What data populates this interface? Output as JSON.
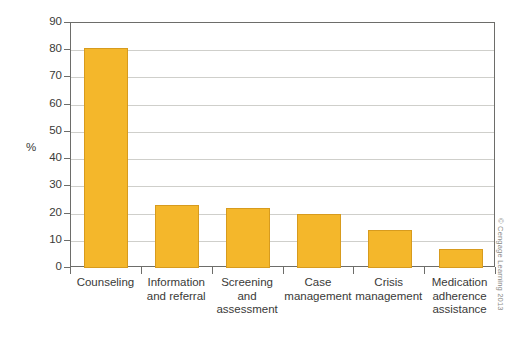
{
  "chart_data": {
    "type": "bar",
    "title": "",
    "xlabel": "",
    "ylabel": "%",
    "ylim": [
      0,
      90
    ],
    "ytick_step": 10,
    "yticks": [
      0,
      10,
      20,
      30,
      40,
      50,
      60,
      70,
      80,
      90
    ],
    "grid": true,
    "legend": null,
    "categories": [
      "Counseling",
      "Information and referral",
      "Screening and assessment",
      "Case management",
      "Crisis management",
      "Medication adherence assistance"
    ],
    "category_lines": [
      [
        "Counseling"
      ],
      [
        "Information",
        "and referral"
      ],
      [
        "Screening",
        "and",
        "assessment"
      ],
      [
        "Case",
        "management"
      ],
      [
        "Crisis",
        "management"
      ],
      [
        "Medication",
        "adherence",
        "assistance"
      ]
    ],
    "values": [
      81,
      23,
      22,
      20,
      14,
      7
    ],
    "bar_color": "#f4b72b",
    "bar_border_color": "#d79b1e",
    "grid_color": "#cfcfcb",
    "axis_color": "#6d6d6a"
  },
  "credit": {
    "text": "© Cengage Learning 2013"
  }
}
